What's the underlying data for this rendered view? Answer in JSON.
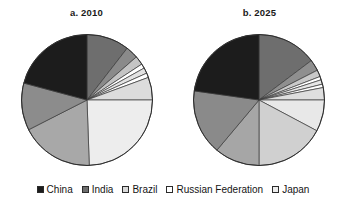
{
  "figure": {
    "panels": [
      {
        "key": "a",
        "title": "a. 2010"
      },
      {
        "key": "b",
        "title": "b. 2025"
      }
    ]
  },
  "legend": {
    "position": "bottom-center",
    "items": [
      {
        "label": "China",
        "swatch_icon": "square-swatch-icon",
        "color": "#1c1c1c"
      },
      {
        "label": "India",
        "swatch_icon": "square-swatch-icon",
        "color": "#6e6e6e"
      },
      {
        "label": "Brazil",
        "swatch_icon": "square-swatch-icon",
        "color": "#d9d9d9"
      },
      {
        "label": "Russian Federation",
        "swatch_icon": "square-swatch-icon",
        "color": "#ffffff"
      },
      {
        "label": "Japan",
        "swatch_icon": "square-swatch-icon",
        "color": "#ededed"
      }
    ]
  },
  "chart_data": [
    {
      "type": "pie",
      "title": "a. 2010",
      "xlabel": "",
      "ylabel": "",
      "grid": false,
      "legend_position": "bottom-center",
      "start_angle_deg": 0,
      "direction": "clockwise",
      "categories": [
        "India",
        "Brazil",
        "Russian Federation",
        "Japan",
        "China"
      ],
      "slices": [
        {
          "label": "India",
          "value": 10.5,
          "color": "#6e6e6e",
          "start_deg": 0.0,
          "end_deg": 37.8
        },
        {
          "label": "Brazil",
          "value": 3.1,
          "color": "#8a8a8a",
          "start_deg": 37.8,
          "end_deg": 48.9
        },
        {
          "label": "Russian Federation",
          "value": 2.2,
          "color": "#c4c4c4",
          "start_deg": 48.9,
          "end_deg": 56.8
        },
        {
          "label": "Japan",
          "value": 1.1,
          "color": "#ffffff",
          "start_deg": 56.8,
          "end_deg": 60.8
        },
        {
          "label": "China",
          "value": 1.4,
          "color": "#e3e3e3",
          "start_deg": 60.8,
          "end_deg": 65.8
        },
        {
          "label": "India",
          "value": 1.1,
          "color": "#ffffff",
          "start_deg": 65.8,
          "end_deg": 69.8
        },
        {
          "label": "Brazil",
          "value": 5.6,
          "color": "#dcdcdc",
          "start_deg": 69.8,
          "end_deg": 90.0
        },
        {
          "label": "Japan",
          "value": 24.4,
          "color": "#ededed",
          "start_deg": 90.0,
          "end_deg": 178.0
        },
        {
          "label": "Russian Federation",
          "value": 18.1,
          "color": "#a8a8a8",
          "start_deg": 178.0,
          "end_deg": 243.0
        },
        {
          "label": "Brazil",
          "value": 11.7,
          "color": "#8c8c8c",
          "start_deg": 243.0,
          "end_deg": 285.0
        },
        {
          "label": "China",
          "value": 20.8,
          "color": "#1c1c1c",
          "start_deg": 285.0,
          "end_deg": 360.0
        }
      ]
    },
    {
      "type": "pie",
      "title": "b. 2025",
      "xlabel": "",
      "ylabel": "",
      "grid": false,
      "legend_position": "bottom-center",
      "start_angle_deg": 0,
      "direction": "clockwise",
      "categories": [
        "India",
        "Brazil",
        "Russian Federation",
        "Japan",
        "China"
      ],
      "slices": [
        {
          "label": "India",
          "value": 14.7,
          "color": "#6e6e6e",
          "start_deg": 0.0,
          "end_deg": 53.0
        },
        {
          "label": "Brazil",
          "value": 2.8,
          "color": "#8f8f8f",
          "start_deg": 53.0,
          "end_deg": 63.0
        },
        {
          "label": "Russian Federation",
          "value": 1.7,
          "color": "#c9c9c9",
          "start_deg": 63.0,
          "end_deg": 69.0
        },
        {
          "label": "Japan",
          "value": 0.8,
          "color": "#ffffff",
          "start_deg": 69.0,
          "end_deg": 72.0
        },
        {
          "label": "China",
          "value": 1.1,
          "color": "#e6e6e6",
          "start_deg": 72.0,
          "end_deg": 76.0
        },
        {
          "label": "India",
          "value": 0.8,
          "color": "#ffffff",
          "start_deg": 76.0,
          "end_deg": 79.0
        },
        {
          "label": "Brazil",
          "value": 3.1,
          "color": "#dedede",
          "start_deg": 79.0,
          "end_deg": 90.0
        },
        {
          "label": "Japan",
          "value": 7.8,
          "color": "#e8e8e8",
          "start_deg": 90.0,
          "end_deg": 118.0
        },
        {
          "label": "Russian Federation",
          "value": 17.2,
          "color": "#d0d0d0",
          "start_deg": 118.0,
          "end_deg": 180.0
        },
        {
          "label": "Brazil",
          "value": 11.1,
          "color": "#a6a6a6",
          "start_deg": 180.0,
          "end_deg": 220.0
        },
        {
          "label": "India",
          "value": 16.1,
          "color": "#8a8a8a",
          "start_deg": 220.0,
          "end_deg": 278.0
        },
        {
          "label": "China",
          "value": 22.8,
          "color": "#1c1c1c",
          "start_deg": 278.0,
          "end_deg": 360.0
        }
      ]
    }
  ]
}
